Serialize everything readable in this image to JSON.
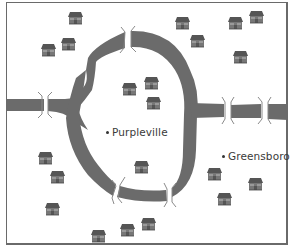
{
  "map": {
    "colors": {
      "road": "#6b6b6b",
      "house_roof": "#5a5a5a",
      "house_body": "#7a7a7a",
      "border": "#6a6a6a",
      "bridge_line": "#8a8a8a"
    },
    "towns": [
      {
        "name": "Purpleville",
        "x": 106,
        "y": 133
      },
      {
        "name": "Greensboro",
        "x": 222,
        "y": 157
      }
    ],
    "houses": [
      {
        "x": 67,
        "y": 12
      },
      {
        "x": 40,
        "y": 44
      },
      {
        "x": 60,
        "y": 38
      },
      {
        "x": 174,
        "y": 17
      },
      {
        "x": 189,
        "y": 35
      },
      {
        "x": 227,
        "y": 17
      },
      {
        "x": 248,
        "y": 11
      },
      {
        "x": 232,
        "y": 51
      },
      {
        "x": 121,
        "y": 83
      },
      {
        "x": 143,
        "y": 77
      },
      {
        "x": 145,
        "y": 97
      },
      {
        "x": 37,
        "y": 152
      },
      {
        "x": 49,
        "y": 171
      },
      {
        "x": 44,
        "y": 203
      },
      {
        "x": 133,
        "y": 161
      },
      {
        "x": 206,
        "y": 168
      },
      {
        "x": 216,
        "y": 193
      },
      {
        "x": 247,
        "y": 178
      },
      {
        "x": 90,
        "y": 230
      },
      {
        "x": 119,
        "y": 224
      },
      {
        "x": 140,
        "y": 218
      }
    ],
    "bridges": [
      {
        "id": "bridge-west",
        "x": 45,
        "y": 104,
        "orient": "v"
      },
      {
        "id": "bridge-north",
        "x": 128,
        "y": 40,
        "orient": "v"
      },
      {
        "id": "bridge-east-1",
        "x": 227,
        "y": 112,
        "orient": "v"
      },
      {
        "id": "bridge-east-2",
        "x": 264,
        "y": 112,
        "orient": "v"
      },
      {
        "id": "bridge-south-west",
        "x": 116,
        "y": 190,
        "orient": "d"
      },
      {
        "id": "bridge-south-east",
        "x": 170,
        "y": 195,
        "orient": "v"
      }
    ]
  }
}
